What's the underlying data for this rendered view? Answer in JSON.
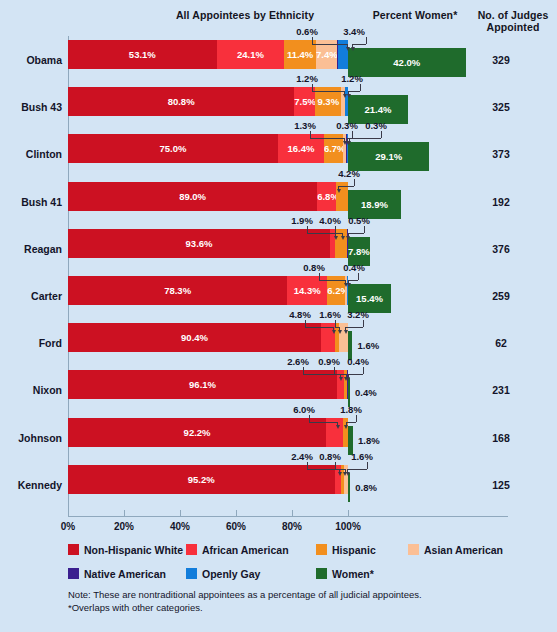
{
  "corner_text": "",
  "headers": {
    "ethnicity": "All Appointees by Ethnicity",
    "women": "Percent Women*",
    "judges": "No. of Judges\nAppointed",
    "judges_line1": "No. of Judges",
    "judges_line2": "Appointed"
  },
  "axis": {
    "ticks": [
      "0%",
      "20%",
      "40%",
      "60%",
      "80%",
      "100%"
    ],
    "tick_values": [
      0,
      20,
      40,
      60,
      80,
      100
    ],
    "min": 0,
    "max": 100
  },
  "legend": {
    "row1": [
      {
        "label": "Non-Hispanic White",
        "color": "#cc1122"
      },
      {
        "label": "African American",
        "color": "#f8303c"
      },
      {
        "label": "Hispanic",
        "color": "#f28f1e"
      },
      {
        "label": "Asian American",
        "color": "#fbbf95"
      }
    ],
    "row2": [
      {
        "label": "Native American",
        "color": "#3a1f8f"
      },
      {
        "label": "Openly Gay",
        "color": "#127ddb"
      },
      {
        "label": "Women*",
        "color": "#1f6b2c"
      }
    ]
  },
  "note_line1": "Note: These are nontraditional appointees as a percentage of all judicial appointees.",
  "note_line2": "*Overlaps with other categories.",
  "chart_data": {
    "type": "bar",
    "title": "All Appointees by Ethnicity",
    "subtitle": "Percent Women*",
    "xlabel": "",
    "ylabel": "",
    "xlim": [
      0,
      100
    ],
    "grid": false,
    "orientation": "horizontal",
    "stacked": true,
    "legend_position": "bottom",
    "categories": [
      "Obama",
      "Bush 43",
      "Clinton",
      "Bush 41",
      "Reagan",
      "Carter",
      "Ford",
      "Nixon",
      "Johnson",
      "Kennedy"
    ],
    "series": [
      {
        "name": "Non-Hispanic White",
        "color": "#cc1122",
        "values": [
          53.1,
          80.8,
          75.0,
          89.0,
          93.6,
          78.3,
          90.4,
          96.1,
          92.2,
          95.2
        ]
      },
      {
        "name": "African American",
        "color": "#f8303c",
        "values": [
          24.1,
          7.5,
          16.4,
          6.8,
          1.9,
          14.3,
          4.8,
          2.6,
          6.0,
          2.4
        ]
      },
      {
        "name": "Hispanic",
        "color": "#f28f1e",
        "values": [
          11.4,
          9.3,
          6.7,
          4.2,
          4.0,
          6.2,
          1.6,
          0.9,
          1.8,
          0.8
        ]
      },
      {
        "name": "Asian American",
        "color": "#fbbf95",
        "values": [
          7.4,
          1.2,
          1.3,
          0.0,
          0.0,
          0.8,
          3.2,
          0.0,
          0.0,
          1.6
        ]
      },
      {
        "name": "Native American",
        "color": "#3a1f8f",
        "values": [
          0.6,
          0.0,
          0.3,
          0.0,
          0.5,
          0.0,
          0.0,
          0.4,
          0.0,
          0.0
        ]
      },
      {
        "name": "Openly Gay",
        "color": "#127ddb",
        "values": [
          3.4,
          1.2,
          0.3,
          0.0,
          0.0,
          0.4,
          0.0,
          0.0,
          0.0,
          0.0
        ]
      },
      {
        "name": "Women*",
        "color": "#1f6b2c",
        "values": [
          42.0,
          21.4,
          29.1,
          18.9,
          7.8,
          15.4,
          1.6,
          0.4,
          1.8,
          0.8
        ]
      }
    ],
    "judges_appointed": [
      329,
      325,
      373,
      192,
      376,
      259,
      168,
      231,
      168,
      125
    ]
  },
  "rows": [
    {
      "name": "Obama",
      "judges": "329",
      "segments": [
        {
          "key": "white",
          "label": "53.1%",
          "value": 53.1,
          "color": "#cc1122",
          "inside": true
        },
        {
          "key": "african",
          "label": "24.1%",
          "value": 24.1,
          "color": "#f8303c",
          "inside": true
        },
        {
          "key": "hispanic",
          "label": "11.4%",
          "value": 11.4,
          "color": "#f28f1e",
          "inside": true
        },
        {
          "key": "asian",
          "label": "7.4%",
          "value": 7.4,
          "color": "#fbbf95",
          "inside": true
        },
        {
          "key": "native",
          "label": "0.6%",
          "value": 0.6,
          "color": "#3a1f8f",
          "inside": false
        },
        {
          "key": "gay",
          "label": "3.4%",
          "value": 3.4,
          "color": "#127ddb",
          "inside": false
        }
      ],
      "women": {
        "label": "42.0%",
        "value": 42.0,
        "inside": true
      },
      "callouts": [
        {
          "text": "0.6%",
          "tx": 293,
          "ty": -14,
          "ax": 347.0,
          "side": "left",
          "anchor": 312
        },
        {
          "text": "3.4%",
          "tx": 340,
          "ty": -14,
          "ax": 352.0,
          "side": "right",
          "anchor": 366
        }
      ]
    },
    {
      "name": "Bush 43",
      "judges": "325",
      "segments": [
        {
          "key": "white",
          "label": "80.8%",
          "value": 80.8,
          "color": "#cc1122",
          "inside": true
        },
        {
          "key": "african",
          "label": "7.5%",
          "value": 7.5,
          "color": "#f8303c",
          "inside": true
        },
        {
          "key": "hispanic",
          "label": "9.3%",
          "value": 9.3,
          "color": "#f28f1e",
          "inside": true
        },
        {
          "key": "asian",
          "label": "1.2%",
          "value": 1.2,
          "color": "#fbbf95",
          "inside": false
        },
        {
          "key": "gay",
          "label": "1.2%",
          "value": 1.2,
          "color": "#127ddb",
          "inside": false
        }
      ],
      "women": {
        "label": "21.4%",
        "value": 21.4,
        "inside": true
      },
      "callouts": [
        {
          "text": "1.2%",
          "tx": 293,
          "ty": -14,
          "ax": 344.0,
          "side": "left",
          "anchor": 312
        },
        {
          "text": "1.2%",
          "tx": 338,
          "ty": -14,
          "ax": 348.0,
          "side": "right",
          "anchor": 360
        }
      ]
    },
    {
      "name": "Clinton",
      "judges": "373",
      "segments": [
        {
          "key": "white",
          "label": "75.0%",
          "value": 75.0,
          "color": "#cc1122",
          "inside": true
        },
        {
          "key": "african",
          "label": "16.4%",
          "value": 16.4,
          "color": "#f8303c",
          "inside": true
        },
        {
          "key": "hispanic",
          "label": "6.7%",
          "value": 6.7,
          "color": "#f28f1e",
          "inside": true
        },
        {
          "key": "asian",
          "label": "1.3%",
          "value": 1.3,
          "color": "#fbbf95",
          "inside": false
        },
        {
          "key": "native",
          "label": "0.3%",
          "value": 0.3,
          "color": "#3a1f8f",
          "inside": false
        },
        {
          "key": "gay",
          "label": "0.3%",
          "value": 0.3,
          "color": "#127ddb",
          "inside": false
        }
      ],
      "women": {
        "label": "29.1%",
        "value": 29.1,
        "inside": true
      },
      "callouts": [
        {
          "text": "1.3%",
          "tx": 291,
          "ty": -14,
          "ax": 344.0,
          "side": "left",
          "anchor": 310
        },
        {
          "text": "0.3%",
          "tx": 333,
          "ty": -14,
          "ax": 347.0,
          "side": "right",
          "anchor": 352
        },
        {
          "text": "0.3%",
          "tx": 362,
          "ty": -14,
          "ax": 348.5,
          "side": "right",
          "anchor": 381
        }
      ]
    },
    {
      "name": "Bush 41",
      "judges": "192",
      "segments": [
        {
          "key": "white",
          "label": "89.0%",
          "value": 89.0,
          "color": "#cc1122",
          "inside": true
        },
        {
          "key": "african",
          "label": "6.8%",
          "value": 6.8,
          "color": "#f8303c",
          "inside": true
        },
        {
          "key": "hispanic",
          "label": "4.2%",
          "value": 4.2,
          "color": "#f28f1e",
          "inside": false
        }
      ],
      "women": {
        "label": "18.9%",
        "value": 18.9,
        "inside": true
      },
      "callouts": [
        {
          "text": "4.2%",
          "tx": 335,
          "ty": -14,
          "ax": 338.0,
          "side": "right",
          "anchor": 354
        }
      ]
    },
    {
      "name": "Reagan",
      "judges": "376",
      "segments": [
        {
          "key": "white",
          "label": "93.6%",
          "value": 93.6,
          "color": "#cc1122",
          "inside": true
        },
        {
          "key": "african",
          "label": "1.9%",
          "value": 1.9,
          "color": "#f8303c",
          "inside": false
        },
        {
          "key": "hispanic",
          "label": "4.0%",
          "value": 4.0,
          "color": "#f28f1e",
          "inside": false
        },
        {
          "key": "native",
          "label": "0.5%",
          "value": 0.5,
          "color": "#3a1f8f",
          "inside": false
        }
      ],
      "women": {
        "label": "7.8%",
        "value": 7.8,
        "inside": true
      },
      "callouts": [
        {
          "text": "1.9%",
          "tx": 288,
          "ty": -14,
          "ax": 335.0,
          "side": "left",
          "anchor": 307
        },
        {
          "text": "4.0%",
          "tx": 316,
          "ty": -14,
          "ax": 342.0,
          "side": "left",
          "anchor": 335
        },
        {
          "text": "0.5%",
          "tx": 345,
          "ty": -14,
          "ax": 347.5,
          "side": "right",
          "anchor": 364
        }
      ]
    },
    {
      "name": "Carter",
      "judges": "259",
      "segments": [
        {
          "key": "white",
          "label": "78.3%",
          "value": 78.3,
          "color": "#cc1122",
          "inside": true
        },
        {
          "key": "african",
          "label": "14.3%",
          "value": 14.3,
          "color": "#f8303c",
          "inside": true
        },
        {
          "key": "hispanic",
          "label": "6.2%",
          "value": 6.2,
          "color": "#f28f1e",
          "inside": true
        },
        {
          "key": "asian",
          "label": "0.8%",
          "value": 0.8,
          "color": "#fbbf95",
          "inside": false
        },
        {
          "key": "gay",
          "label": "0.4%",
          "value": 0.4,
          "color": "#127ddb",
          "inside": false
        }
      ],
      "women": {
        "label": "15.4%",
        "value": 15.4,
        "inside": true
      },
      "callouts": [
        {
          "text": "0.8%",
          "tx": 300,
          "ty": -14,
          "ax": 345.0,
          "side": "left",
          "anchor": 319
        },
        {
          "text": "0.4%",
          "tx": 340,
          "ty": -14,
          "ax": 348.0,
          "side": "right",
          "anchor": 358
        }
      ]
    },
    {
      "name": "Ford",
      "judges": "62",
      "segments": [
        {
          "key": "white",
          "label": "90.4%",
          "value": 90.4,
          "color": "#cc1122",
          "inside": true
        },
        {
          "key": "african",
          "label": "4.8%",
          "value": 4.8,
          "color": "#f8303c",
          "inside": false
        },
        {
          "key": "hispanic",
          "label": "1.6%",
          "value": 1.6,
          "color": "#f28f1e",
          "inside": false
        },
        {
          "key": "asian",
          "label": "3.2%",
          "value": 3.2,
          "color": "#fbbf95",
          "inside": false
        }
      ],
      "women": {
        "label": "1.6%",
        "value": 1.6,
        "inside": false
      },
      "callouts": [
        {
          "text": "4.8%",
          "tx": 286,
          "ty": -14,
          "ax": 333.0,
          "side": "left",
          "anchor": 305
        },
        {
          "text": "1.6%",
          "tx": 316,
          "ty": -14,
          "ax": 339.0,
          "side": "left",
          "anchor": 335
        },
        {
          "text": "3.2%",
          "tx": 344,
          "ty": -14,
          "ax": 345.0,
          "side": "right",
          "anchor": 363
        }
      ]
    },
    {
      "name": "Nixon",
      "judges": "231",
      "segments": [
        {
          "key": "white",
          "label": "96.1%",
          "value": 96.1,
          "color": "#cc1122",
          "inside": true
        },
        {
          "key": "african",
          "label": "2.6%",
          "value": 2.6,
          "color": "#f8303c",
          "inside": false
        },
        {
          "key": "hispanic",
          "label": "0.9%",
          "value": 0.9,
          "color": "#f28f1e",
          "inside": false
        },
        {
          "key": "native",
          "label": "0.4%",
          "value": 0.4,
          "color": "#3a1f8f",
          "inside": false
        }
      ],
      "women": {
        "label": "0.4%",
        "value": 0.4,
        "inside": false
      },
      "callouts": [
        {
          "text": "2.6%",
          "tx": 284,
          "ty": -14,
          "ax": 340.0,
          "side": "left",
          "anchor": 303
        },
        {
          "text": "0.9%",
          "tx": 315,
          "ty": -14,
          "ax": 345.5,
          "side": "left",
          "anchor": 334
        },
        {
          "text": "0.4%",
          "tx": 344,
          "ty": -14,
          "ax": 347.5,
          "side": "right",
          "anchor": 363
        }
      ]
    },
    {
      "name": "Johnson",
      "judges": "168",
      "segments": [
        {
          "key": "white",
          "label": "92.2%",
          "value": 92.2,
          "color": "#cc1122",
          "inside": true
        },
        {
          "key": "african",
          "label": "6.0%",
          "value": 6.0,
          "color": "#f8303c",
          "inside": false
        },
        {
          "key": "hispanic",
          "label": "1.8%",
          "value": 1.8,
          "color": "#f28f1e",
          "inside": false
        }
      ],
      "women": {
        "label": "1.8%",
        "value": 1.8,
        "inside": false
      },
      "callouts": [
        {
          "text": "6.0%",
          "tx": 290,
          "ty": -14,
          "ax": 337.0,
          "side": "left",
          "anchor": 309
        },
        {
          "text": "1.8%",
          "tx": 337,
          "ty": -14,
          "ax": 345.5,
          "side": "right",
          "anchor": 356
        }
      ]
    },
    {
      "name": "Kennedy",
      "judges": "125",
      "segments": [
        {
          "key": "white",
          "label": "95.2%",
          "value": 95.2,
          "color": "#cc1122",
          "inside": true
        },
        {
          "key": "african",
          "label": "2.4%",
          "value": 2.4,
          "color": "#f8303c",
          "inside": false
        },
        {
          "key": "hispanic",
          "label": "0.8%",
          "value": 0.8,
          "color": "#f28f1e",
          "inside": false
        },
        {
          "key": "asian",
          "label": "1.6%",
          "value": 1.6,
          "color": "#fbbf95",
          "inside": false
        }
      ],
      "women": {
        "label": "0.8%",
        "value": 0.8,
        "inside": false
      },
      "callouts": [
        {
          "text": "2.4%",
          "tx": 288,
          "ty": -14,
          "ax": 339.0,
          "side": "left",
          "anchor": 307
        },
        {
          "text": "0.8%",
          "tx": 316,
          "ty": -14,
          "ax": 344.5,
          "side": "left",
          "anchor": 335
        },
        {
          "text": "1.6%",
          "tx": 348,
          "ty": -14,
          "ax": 347.0,
          "side": "right",
          "anchor": 367
        }
      ]
    }
  ]
}
